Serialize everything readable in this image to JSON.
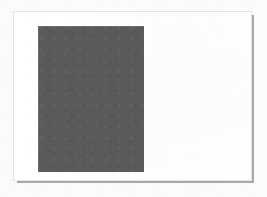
{
  "figure": {
    "canvas": {
      "width": 267,
      "height": 197,
      "background_color": "#fbfbfb"
    },
    "card": {
      "name": "white-page",
      "x": 13,
      "y": 11,
      "width": 239,
      "height": 170,
      "fill_color": "#ffffff",
      "border_color": "#e2e2e2",
      "shadow_color": "#9a9a9a"
    },
    "shapes": [
      {
        "name": "dark-rectangle",
        "type": "rectangle",
        "x": 37,
        "y": 25,
        "width": 106,
        "height": 146,
        "fill_color": "#5a5a5a",
        "edge_color": "#6b6b6b",
        "label": ""
      }
    ]
  }
}
